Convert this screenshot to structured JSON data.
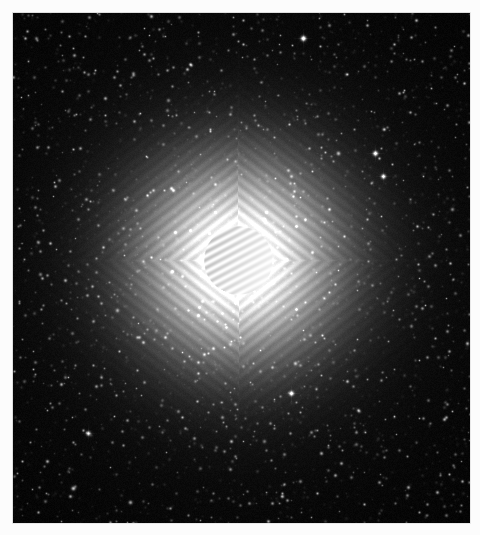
{
  "image": {
    "kind": "astronomical-photograph",
    "subject": "saturated-bright-star",
    "alt_text": "Monochrome astronomical image of an extremely bright saturated star surrounded by a dense field of faint stars",
    "width": 480,
    "height": 535,
    "frame": {
      "border_color": "#fcfcfc",
      "border_left": 13,
      "border_top": 13,
      "border_right": 10,
      "border_bottom": 12,
      "plate_edge_color": "#dedede"
    },
    "field": {
      "x": 13,
      "y": 13,
      "width": 457,
      "height": 510,
      "background_color": "#000000",
      "noise_color": "#1a1a1a",
      "star_color": "#ffffff"
    }
  },
  "chart_data": {
    "type": "heatmap",
    "xlabel": "",
    "ylabel": "",
    "colormap": "grayscale",
    "value_range": [
      0,
      255
    ],
    "grid": false,
    "legend_position": "none",
    "primary_source": {
      "label": "saturated-core",
      "center_x": 238,
      "center_y": 260,
      "core_radius": 35,
      "core_intensity": 255,
      "halo_radius": 130,
      "halo_falloff": "gaussian",
      "fringe_count": 11,
      "fringe_angle_deg": 62,
      "fringe_spacing_px": 7,
      "fringe_contrast": 0.28
    },
    "diffraction_spikes": [
      {
        "label": "vertical-spike",
        "angle_deg": 90,
        "length": 250,
        "thickness": 1,
        "intensity": 0.22
      },
      {
        "label": "horizontal-spike",
        "angle_deg": 0,
        "length": 250,
        "thickness": 1,
        "intensity": 0.18
      }
    ],
    "diffraction_ripples": {
      "label": "diagonal-interference-ripples",
      "angle_a_deg": 52,
      "angle_b_deg": -52,
      "wavelength_px": 9,
      "radius_extent": 200,
      "amplitude": 0.16
    },
    "bright_stars": [
      {
        "x": 303,
        "y": 38,
        "magnitude": 9.0
      },
      {
        "x": 375,
        "y": 153,
        "magnitude": 8.6
      },
      {
        "x": 383,
        "y": 176,
        "magnitude": 8.2
      },
      {
        "x": 338,
        "y": 153,
        "magnitude": 7.0
      },
      {
        "x": 452,
        "y": 209,
        "magnitude": 6.6
      },
      {
        "x": 168,
        "y": 100,
        "magnitude": 6.4
      },
      {
        "x": 167,
        "y": 110,
        "magnitude": 6.2
      },
      {
        "x": 163,
        "y": 144,
        "magnitude": 6.0
      },
      {
        "x": 88,
        "y": 433,
        "magnitude": 8.0
      },
      {
        "x": 73,
        "y": 488,
        "magnitude": 7.4
      },
      {
        "x": 130,
        "y": 502,
        "magnitude": 7.0
      },
      {
        "x": 291,
        "y": 393,
        "magnitude": 8.4
      },
      {
        "x": 295,
        "y": 363,
        "magnitude": 6.8
      },
      {
        "x": 117,
        "y": 310,
        "magnitude": 6.6
      },
      {
        "x": 264,
        "y": 441,
        "magnitude": 6.4
      },
      {
        "x": 356,
        "y": 444,
        "magnitude": 6.2
      },
      {
        "x": 438,
        "y": 357,
        "magnitude": 6.0
      },
      {
        "x": 40,
        "y": 274,
        "magnitude": 6.4
      },
      {
        "x": 24,
        "y": 381,
        "magnitude": 6.0
      },
      {
        "x": 99,
        "y": 174,
        "magnitude": 6.0
      },
      {
        "x": 200,
        "y": 468,
        "magnitude": 6.0
      },
      {
        "x": 419,
        "y": 270,
        "magnitude": 5.8
      },
      {
        "x": 405,
        "y": 96,
        "magnitude": 5.8
      },
      {
        "x": 63,
        "y": 60,
        "magnitude": 5.8
      },
      {
        "x": 246,
        "y": 126,
        "magnitude": 5.6
      }
    ],
    "faint_star_count": 2400,
    "background_noise_sigma": 7
  }
}
